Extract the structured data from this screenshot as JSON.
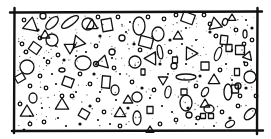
{
  "figure": {
    "title": "Concrete section hatch",
    "element_kinds": [
      "triangle",
      "quadrilateral",
      "ellipse",
      "circle",
      "dot",
      "stipple"
    ],
    "colors": {
      "ink": "#111111",
      "background": "#ffffff"
    }
  }
}
